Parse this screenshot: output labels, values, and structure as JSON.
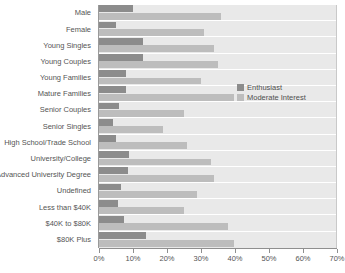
{
  "chart_data": {
    "type": "bar",
    "orientation": "horizontal",
    "title": "",
    "xlabel": "",
    "ylabel": "",
    "xlim": [
      0,
      70
    ],
    "xticks": [
      0,
      10,
      20,
      30,
      40,
      50,
      60,
      70
    ],
    "xtick_labels": [
      "0%",
      "10%",
      "20%",
      "30%",
      "40%",
      "50%",
      "60%",
      "70%"
    ],
    "grid": false,
    "legend_position": "right",
    "categories": [
      "Male",
      "Female",
      "Young Singles",
      "Young Couples",
      "Young Families",
      "Mature Families",
      "Senior Couples",
      "Senior Singles",
      "High School/Trade School",
      "University/College",
      "Advanced University Degree",
      "Undefined",
      "Less than $40K",
      "$40K to $80K",
      "$80K Plus"
    ],
    "series": [
      {
        "name": "Enthusiast",
        "color": "#8c8c8c",
        "values": [
          10,
          5,
          13,
          13,
          8,
          8,
          6,
          4,
          5,
          9,
          8.5,
          6.5,
          5.5,
          7.5,
          14
        ]
      },
      {
        "name": "Moderate Interest",
        "color": "#bdbdbd",
        "values": [
          36,
          31,
          34,
          35,
          30,
          40,
          25,
          19,
          26,
          33,
          34,
          29,
          25,
          38,
          40
        ]
      }
    ]
  },
  "legend": {
    "items": [
      {
        "label": "Enthusiast",
        "color": "#8c8c8c"
      },
      {
        "label": "Moderate Interest",
        "color": "#bdbdbd"
      }
    ]
  },
  "colors": {
    "enthusiast": "#8c8c8c",
    "moderate": "#bdbdbd",
    "plot_background": "#e9e9e9",
    "page_background": "#ffffff",
    "axis": "#8f8f8f",
    "text": "#555555"
  }
}
